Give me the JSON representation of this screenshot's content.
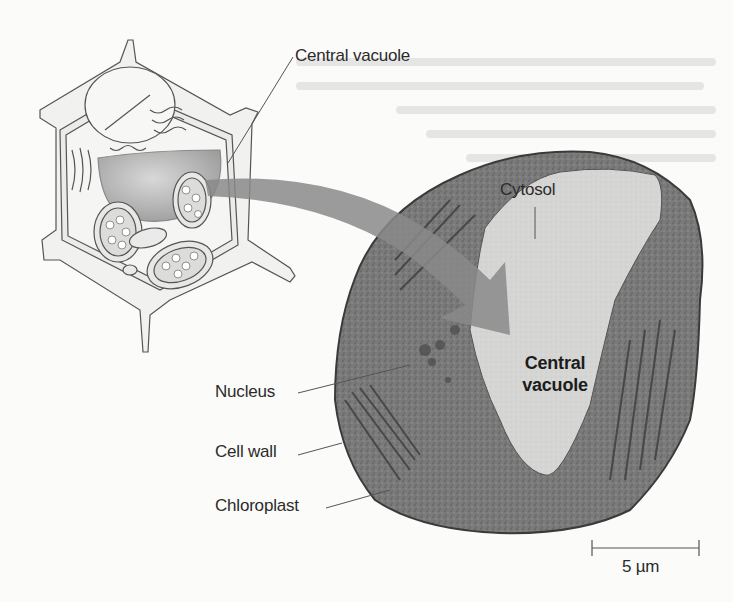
{
  "figure": {
    "type": "biology-diagram",
    "panels": [
      {
        "id": "illustration",
        "description": "3D cutaway drawing of plant cell with shaded central vacuole"
      },
      {
        "id": "micrograph",
        "description": "electron micrograph of plant cell cross-section"
      }
    ],
    "labels": {
      "illustration_vacuole": "Central vacuole",
      "cytosol": "Cytosol",
      "micrograph_vacuole_line1": "Central",
      "micrograph_vacuole_line2": "vacuole",
      "nucleus": "Nucleus",
      "cell_wall": "Cell wall",
      "chloroplast": "Chloroplast"
    },
    "scale_bar": {
      "label": "5 µm"
    },
    "colors": {
      "background": "#fbfbfa",
      "label_text": "#2b2b2b",
      "arrow": "#8a8a8a",
      "micrograph_dark": "#5e5e5e",
      "micrograph_vacuole": "#d6d6d4",
      "vacuole_shading": "#b9b9b9"
    }
  }
}
